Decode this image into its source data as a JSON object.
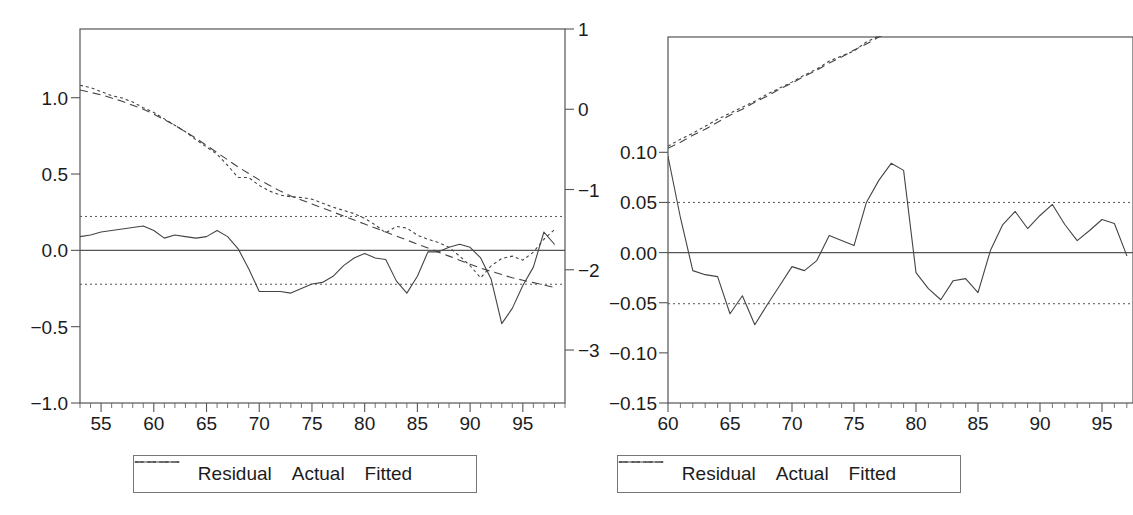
{
  "chart_data": [
    {
      "id": "left-panel",
      "type": "line",
      "title": "",
      "xlabel": "",
      "ylabel": "",
      "xlim": [
        53,
        99
      ],
      "x_ticks": [
        55,
        60,
        65,
        70,
        75,
        80,
        85,
        90,
        95
      ],
      "x_tick_labels": [
        "55",
        "60",
        "65",
        "70",
        "75",
        "80",
        "85",
        "90",
        "95"
      ],
      "x_minor_tick_step": 1,
      "left_axis": {
        "label": "",
        "ylim": [
          -1.0,
          1.45
        ],
        "ticks": [
          1.0,
          0.5,
          0.0,
          -0.5,
          -1.0
        ],
        "tick_labels": [
          "1.0",
          "0.5",
          "0.0",
          "-0.5",
          "-1.0"
        ]
      },
      "right_axis": {
        "label": "",
        "ylim": [
          -3.66,
          1.0
        ],
        "ticks": [
          1,
          0,
          -1,
          -2,
          -3
        ],
        "tick_labels": [
          "1",
          "0",
          "-1",
          "-2",
          "-3"
        ]
      },
      "grid": false,
      "zero_line": 0.0,
      "band_lines": [
        0.222,
        -0.222
      ],
      "legend_position": "below",
      "series": [
        {
          "name": "Residual",
          "axis": "left",
          "style": "solid",
          "x": [
            53,
            54,
            55,
            56,
            57,
            58,
            59,
            60,
            61,
            62,
            63,
            64,
            65,
            66,
            67,
            68,
            69,
            70,
            71,
            72,
            73,
            74,
            75,
            76,
            77,
            78,
            79,
            80,
            81,
            82,
            83,
            84,
            85,
            86,
            87,
            88,
            89,
            90,
            91,
            92,
            93,
            94,
            95,
            96,
            97,
            98
          ],
          "values": [
            0.09,
            0.1,
            0.12,
            0.13,
            0.14,
            0.15,
            0.16,
            0.13,
            0.08,
            0.1,
            0.09,
            0.08,
            0.09,
            0.13,
            0.09,
            0.01,
            -0.12,
            -0.27,
            -0.27,
            -0.27,
            -0.28,
            -0.25,
            -0.22,
            -0.21,
            -0.17,
            -0.1,
            -0.05,
            -0.02,
            -0.05,
            -0.06,
            -0.2,
            -0.28,
            -0.17,
            -0.01,
            -0.01,
            0.02,
            0.04,
            0.02,
            -0.05,
            -0.19,
            -0.48,
            -0.38,
            -0.23,
            -0.11,
            0.12,
            0.04,
            0.22,
            0.55,
            0.8
          ]
        },
        {
          "name": "Actual",
          "axis": "right",
          "style": "dotted",
          "x": [
            53,
            54,
            55,
            56,
            57,
            58,
            59,
            60,
            61,
            62,
            63,
            64,
            65,
            66,
            67,
            68,
            69,
            70,
            71,
            72,
            73,
            74,
            75,
            76,
            77,
            78,
            79,
            80,
            81,
            82,
            83,
            84,
            85,
            86,
            87,
            88,
            89,
            90,
            91,
            92,
            93,
            94,
            95,
            96,
            97,
            98
          ],
          "values": [
            0.3,
            0.27,
            0.22,
            0.17,
            0.14,
            0.09,
            0.02,
            -0.04,
            -0.12,
            -0.2,
            -0.28,
            -0.38,
            -0.47,
            -0.56,
            -0.7,
            -0.85,
            -0.85,
            -0.95,
            -1.02,
            -1.07,
            -1.09,
            -1.1,
            -1.12,
            -1.17,
            -1.22,
            -1.26,
            -1.3,
            -1.36,
            -1.44,
            -1.54,
            -1.46,
            -1.48,
            -1.57,
            -1.62,
            -1.66,
            -1.72,
            -1.83,
            -1.95,
            -2.1,
            -1.95,
            -1.86,
            -1.83,
            -1.88,
            -1.78,
            -1.62,
            -1.5
          ]
        },
        {
          "name": "Fitted",
          "axis": "right",
          "style": "dashed",
          "x": [
            53,
            54,
            55,
            56,
            57,
            58,
            59,
            60,
            61,
            62,
            63,
            64,
            65,
            66,
            67,
            68,
            69,
            70,
            71,
            72,
            73,
            74,
            75,
            76,
            77,
            78,
            79,
            80,
            81,
            82,
            83,
            84,
            85,
            86,
            87,
            88,
            89,
            90,
            91,
            92,
            93,
            94,
            95,
            96,
            97,
            98
          ],
          "values": [
            0.24,
            0.21,
            0.18,
            0.14,
            0.1,
            0.05,
            0.0,
            -0.06,
            -0.13,
            -0.2,
            -0.28,
            -0.36,
            -0.45,
            -0.54,
            -0.63,
            -0.72,
            -0.8,
            -0.88,
            -0.95,
            -1.02,
            -1.08,
            -1.13,
            -1.18,
            -1.23,
            -1.28,
            -1.33,
            -1.38,
            -1.43,
            -1.48,
            -1.53,
            -1.58,
            -1.63,
            -1.68,
            -1.73,
            -1.78,
            -1.83,
            -1.88,
            -1.93,
            -1.98,
            -2.02,
            -2.06,
            -2.1,
            -2.13,
            -2.16,
            -2.19,
            -2.22
          ]
        }
      ],
      "legend": [
        {
          "label": "Residual",
          "style": "solid"
        },
        {
          "label": "Actual",
          "style": "dotted"
        },
        {
          "label": "Fitted",
          "style": "dashed"
        }
      ]
    },
    {
      "id": "right-panel",
      "type": "line",
      "title": "",
      "xlabel": "",
      "ylabel": "",
      "xlim": [
        60,
        97.5
      ],
      "x_ticks": [
        60,
        65,
        70,
        75,
        80,
        85,
        90,
        95
      ],
      "x_tick_labels": [
        "60",
        "65",
        "70",
        "75",
        "80",
        "85",
        "90",
        "95"
      ],
      "x_minor_tick_step": 1,
      "left_axis": {
        "label": "",
        "ylim": [
          -0.15,
          0.215
        ],
        "ticks": [
          0.1,
          0.05,
          0.0,
          -0.05,
          -0.1,
          -0.15
        ],
        "tick_labels": [
          "0.10",
          "0.05",
          "0.00",
          "-0.05",
          "-0.10",
          "-0.15"
        ]
      },
      "right_axis": {
        "label": "",
        "ylim": [
          -0.15,
          0.215
        ],
        "ticks": [],
        "tick_labels": []
      },
      "grid": false,
      "zero_line": 0.0,
      "band_lines": [
        0.05,
        -0.051
      ],
      "legend_position": "below",
      "series": [
        {
          "name": "Residual",
          "axis": "left",
          "style": "solid",
          "x": [
            60,
            61,
            62,
            63,
            64,
            65,
            66,
            67,
            68,
            69,
            70,
            71,
            72,
            73,
            74,
            75,
            76,
            77,
            78,
            79,
            80,
            81,
            82,
            83,
            84,
            85,
            86,
            87,
            88,
            89,
            90,
            91,
            92,
            93,
            94,
            95,
            96,
            97
          ],
          "values": [
            0.096,
            0.035,
            -0.018,
            -0.022,
            -0.024,
            -0.061,
            -0.043,
            -0.072,
            -0.052,
            -0.033,
            -0.014,
            -0.018,
            -0.008,
            0.017,
            0.012,
            0.007,
            0.05,
            0.072,
            0.089,
            0.082,
            -0.02,
            -0.036,
            -0.047,
            -0.028,
            -0.026,
            -0.04,
            0.002,
            0.028,
            0.041,
            0.024,
            0.037,
            0.048,
            0.028,
            0.012,
            0.022,
            0.033,
            0.029,
            -0.003
          ]
        },
        {
          "name": "Actual",
          "axis": "right",
          "style": "dotted",
          "x": [
            60,
            61,
            62,
            63,
            64,
            65,
            66,
            67,
            68,
            69,
            70,
            71,
            72,
            73,
            74,
            75,
            76,
            77,
            78,
            79,
            80,
            81,
            82,
            83,
            84,
            85,
            86,
            87,
            88,
            89,
            90,
            91,
            92,
            93,
            94,
            95,
            96,
            97
          ],
          "values": [
            0.106,
            0.113,
            0.119,
            0.126,
            0.133,
            0.139,
            0.145,
            0.151,
            0.158,
            0.164,
            0.17,
            0.177,
            0.183,
            0.191,
            0.196,
            0.201,
            0.21,
            0.216,
            0.223,
            0.229,
            0.232,
            0.238,
            0.244,
            0.252,
            0.258,
            0.263,
            0.271,
            0.279,
            0.286,
            0.291,
            0.299,
            0.307,
            0.312,
            0.317,
            0.324,
            0.331,
            0.337,
            0.341
          ]
        },
        {
          "name": "Fitted",
          "axis": "right",
          "style": "dashed",
          "x": [
            60,
            61,
            62,
            63,
            64,
            65,
            66,
            67,
            68,
            69,
            70,
            71,
            72,
            73,
            74,
            75,
            76,
            77,
            78,
            79,
            80,
            81,
            82,
            83,
            84,
            85,
            86,
            87,
            88,
            89,
            90,
            91,
            92,
            93,
            94,
            95,
            96,
            97
          ],
          "values": [
            0.104,
            0.11,
            0.117,
            0.123,
            0.13,
            0.137,
            0.143,
            0.15,
            0.156,
            0.163,
            0.169,
            0.176,
            0.182,
            0.189,
            0.195,
            0.202,
            0.208,
            0.215,
            0.221,
            0.228,
            0.234,
            0.241,
            0.247,
            0.254,
            0.26,
            0.267,
            0.273,
            0.28,
            0.286,
            0.293,
            0.299,
            0.306,
            0.312,
            0.319,
            0.325,
            0.332,
            0.338,
            0.344
          ]
        }
      ],
      "legend": [
        {
          "label": "Residual",
          "style": "solid"
        },
        {
          "label": "Actual",
          "style": "dotted"
        },
        {
          "label": "Fitted",
          "style": "dashed"
        }
      ]
    }
  ],
  "colors": {
    "ink": "#444444",
    "axis": "#555555",
    "text": "#1c1c1c",
    "background": "#ffffff",
    "legend_border": "#777777"
  }
}
